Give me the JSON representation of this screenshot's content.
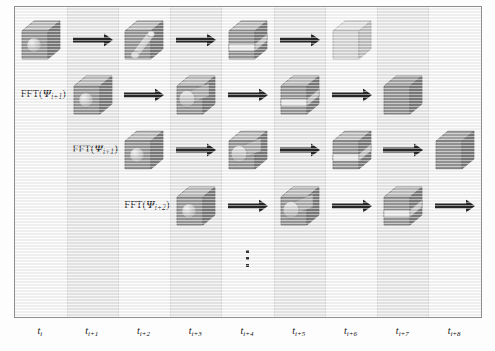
{
  "figure": {
    "type": "process-flow-diagram",
    "frame": {
      "border_color": "#8e8e8e",
      "background": "#fefefe"
    }
  },
  "axis": {
    "tick_labels": [
      {
        "base": "t",
        "sub": "i"
      },
      {
        "base": "t",
        "sub": "i+1"
      },
      {
        "base": "t",
        "sub": "i+2"
      },
      {
        "base": "t",
        "sub": "i+3"
      },
      {
        "base": "t",
        "sub": "i+4"
      },
      {
        "base": "t",
        "sub": "i+5"
      },
      {
        "base": "t",
        "sub": "i+6"
      },
      {
        "base": "t",
        "sub": "i+7"
      },
      {
        "base": "t",
        "sub": "i+8"
      }
    ],
    "tick_text": [
      "t i",
      "t i+1",
      "t i+2",
      "t i+3",
      "t i+4",
      "t i+5",
      "t i+6",
      "t i+7",
      "t i+8"
    ]
  },
  "row_labels": [
    {
      "prefix": "FFT(",
      "psi": "Ψ",
      "sub": "i",
      "suffix": ")"
    },
    {
      "prefix": "FFT(",
      "psi": "Ψ",
      "sub": "i+1",
      "suffix": ")"
    },
    {
      "prefix": "FFT(",
      "psi": "Ψ",
      "sub": "i+1",
      "suffix": ")"
    },
    {
      "prefix": "FFT(",
      "psi": "Ψ",
      "sub": "i+2",
      "suffix": ")"
    }
  ],
  "rows": [
    {
      "name": "row-1",
      "label_text": "FFT(Ψ i)",
      "start_column": 0,
      "stages": [
        {
          "column": 0,
          "shape": "cube-with-sphere"
        },
        {
          "column": 2,
          "shape": "cube-with-tilted-cylinder"
        },
        {
          "column": 4,
          "shape": "cube-with-slab"
        },
        {
          "column": 6,
          "shape": "plain-cube-light"
        }
      ],
      "arrows": [
        1,
        3,
        5
      ]
    },
    {
      "name": "row-2",
      "label_text": "FFT(Ψ i+1)",
      "start_column": 1,
      "stages": [
        {
          "column": 1,
          "shape": "cube-with-sphere"
        },
        {
          "column": 3,
          "shape": "cube-with-cylinder"
        },
        {
          "column": 5,
          "shape": "cube-with-slab"
        },
        {
          "column": 7,
          "shape": "plain-cube-dark"
        }
      ],
      "arrows": [
        2,
        4,
        6
      ]
    },
    {
      "name": "row-3",
      "label_text": "FFT(Ψ i+1)",
      "start_column": 2,
      "stages": [
        {
          "column": 2,
          "shape": "cube-with-sphere"
        },
        {
          "column": 4,
          "shape": "cube-with-cylinder"
        },
        {
          "column": 6,
          "shape": "cube-with-slab"
        },
        {
          "column": 8,
          "shape": "plain-cube-dark"
        }
      ],
      "arrows": [
        3,
        5,
        7
      ]
    },
    {
      "name": "row-4",
      "label_text": "FFT(Ψ i+2)",
      "start_column": 3,
      "stages": [
        {
          "column": 3,
          "shape": "cube-with-sphere"
        },
        {
          "column": 5,
          "shape": "cube-with-cylinder"
        },
        {
          "column": 7,
          "shape": "cube-with-slab"
        }
      ],
      "arrows": [
        4,
        6,
        8
      ]
    }
  ],
  "ellipsis": {
    "column": 4,
    "dots": 3,
    "orientation": "vertical"
  },
  "colors": {
    "band_shade": "#ececec",
    "band_plain": "#fcfcfc",
    "arrow": "#0d0d0d",
    "cube_front_mid": "#8f8f8f",
    "cube_top_light": "#b9b9b9",
    "cube_side_dark": "#6e6e6e",
    "cube_light": "#cfcfcf",
    "cube_dark": "#7d7d7d",
    "inclusion": "#c9c9c9",
    "text": "#111111"
  }
}
